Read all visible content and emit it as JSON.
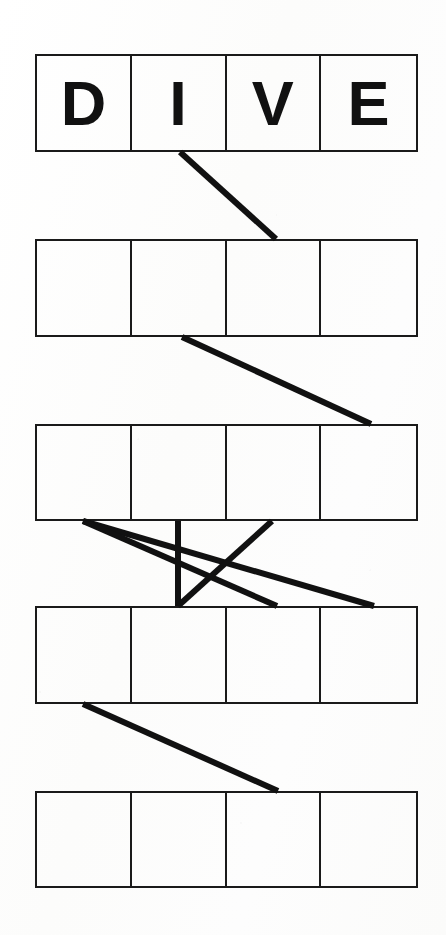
{
  "sheet": {
    "title": "Word Ladder Puzzle Worksheet",
    "background_color": "#fdfdfc",
    "ink_color": "#1a1a1a",
    "width": 446,
    "height": 935
  },
  "rows": [
    {
      "index": 0,
      "name": "row-1-dive",
      "filled": true,
      "word": "DIVE",
      "cells": [
        "D",
        "I",
        "V",
        "E"
      ],
      "x": 35,
      "y": 54,
      "width": 383,
      "height": 98
    },
    {
      "index": 1,
      "name": "row-2-blank",
      "filled": false,
      "word": "",
      "cells": [
        "",
        "",
        "",
        ""
      ],
      "x": 35,
      "y": 239,
      "width": 383,
      "height": 98
    },
    {
      "index": 2,
      "name": "row-3-blank",
      "filled": false,
      "word": "",
      "cells": [
        "",
        "",
        "",
        ""
      ],
      "x": 35,
      "y": 424,
      "width": 383,
      "height": 97
    },
    {
      "index": 3,
      "name": "row-4-blank",
      "filled": false,
      "word": "",
      "cells": [
        "",
        "",
        "",
        ""
      ],
      "x": 35,
      "y": 606,
      "width": 383,
      "height": 98
    },
    {
      "index": 4,
      "name": "row-5-blank",
      "filled": false,
      "word": "",
      "cells": [
        "",
        "",
        "",
        ""
      ],
      "x": 35,
      "y": 791,
      "width": 383,
      "height": 97
    }
  ],
  "connectors": {
    "stroke_color": "#111111",
    "stroke_width": 6,
    "lines": [
      {
        "name": "connector-row1-to-row2",
        "x1": 180,
        "y1": 152,
        "x2": 276,
        "y2": 239
      },
      {
        "name": "connector-row2-to-row3",
        "x1": 182,
        "y1": 337,
        "x2": 371,
        "y2": 424
      },
      {
        "name": "connector-row3-to-row4-a",
        "x1": 83,
        "y1": 521,
        "x2": 374,
        "y2": 606
      },
      {
        "name": "connector-row3-to-row4-b",
        "x1": 83,
        "y1": 521,
        "x2": 277,
        "y2": 606
      },
      {
        "name": "connector-row3-to-row4-vertical",
        "x1": 178,
        "y1": 521,
        "x2": 178,
        "y2": 606
      },
      {
        "name": "connector-row4-to-row3-diagonal",
        "x1": 178,
        "y1": 606,
        "x2": 272,
        "y2": 521
      },
      {
        "name": "connector-row4-to-row5",
        "x1": 83,
        "y1": 704,
        "x2": 278,
        "y2": 791
      }
    ]
  }
}
